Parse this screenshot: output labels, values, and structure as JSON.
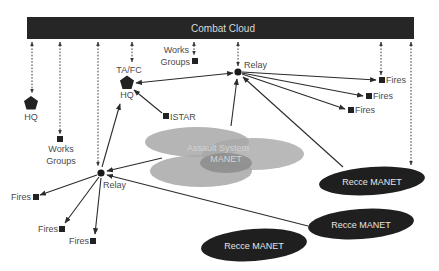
{
  "colors": {
    "cloud_bar": "#262626",
    "node": "#222222",
    "label": "#4a4a4a",
    "assault_fill": "#a8a8a8",
    "assault_inner": "#8c8c8c",
    "recce_fill": "#1f1f1f"
  },
  "combat_cloud": {
    "label": "Combat Cloud"
  },
  "nodes": {
    "hq_left": {
      "label": "HQ"
    },
    "works_groups_left": {
      "line1": "Works",
      "line2": "Groups"
    },
    "ta_fc_hq": {
      "top_label": "TA/FC",
      "bottom_label": "HQ"
    },
    "works_groups_top": {
      "line1": "Works",
      "line2": "Groups"
    },
    "istar": {
      "label": "ISTAR"
    },
    "relay_top": {
      "label": "Relay"
    },
    "relay_bottom": {
      "label": "Relay"
    },
    "fires_right": [
      {
        "label": "Fires"
      },
      {
        "label": "Fires"
      },
      {
        "label": "Fires"
      }
    ],
    "fires_left": [
      {
        "label": "Fires"
      },
      {
        "label": "Fires"
      },
      {
        "label": "Fires"
      }
    ],
    "assault_manet": {
      "line1": "Assault System",
      "line2": "MANET"
    },
    "recce_manets": [
      {
        "label": "Recce MANET"
      },
      {
        "label": "Recce MANET"
      },
      {
        "label": "Recce MANET"
      }
    ]
  }
}
